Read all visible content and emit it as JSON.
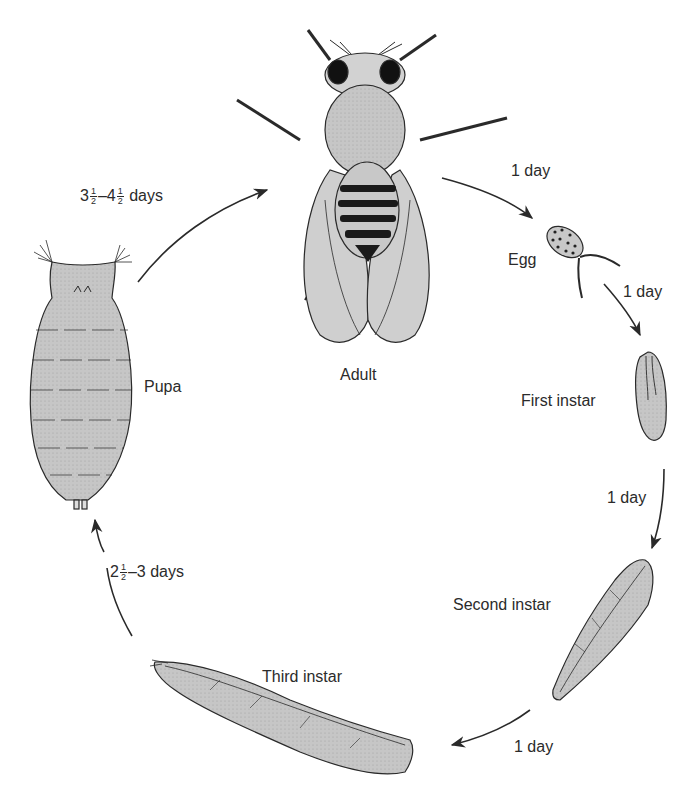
{
  "diagram": {
    "type": "life-cycle",
    "stages": [
      {
        "id": "adult",
        "label": "Adult"
      },
      {
        "id": "egg",
        "label": "Egg"
      },
      {
        "id": "first-instar",
        "label": "First instar"
      },
      {
        "id": "second-instar",
        "label": "Second instar"
      },
      {
        "id": "third-instar",
        "label": "Third instar"
      },
      {
        "id": "pupa",
        "label": "Pupa"
      }
    ],
    "transitions": [
      {
        "from": "adult",
        "to": "egg",
        "duration": "1 day"
      },
      {
        "from": "egg",
        "to": "first-instar",
        "duration": "1 day"
      },
      {
        "from": "first-instar",
        "to": "second-instar",
        "duration": "1 day"
      },
      {
        "from": "second-instar",
        "to": "third-instar",
        "duration": "1 day"
      },
      {
        "from": "third-instar",
        "to": "pupa",
        "duration_prefix": "2",
        "duration_frac": [
          "1",
          "2"
        ],
        "duration_suffix": "–3 days"
      },
      {
        "from": "pupa",
        "to": "adult",
        "duration_a": "3",
        "duration_a_frac": [
          "1",
          "2"
        ],
        "duration_mid": "–4",
        "duration_b_frac": [
          "1",
          "2"
        ],
        "duration_suffix": " days"
      }
    ]
  },
  "colors": {
    "body_fill": "#c4c4c4",
    "outline": "#2a2a2a",
    "text": "#2b2b2b",
    "background": "#ffffff"
  }
}
